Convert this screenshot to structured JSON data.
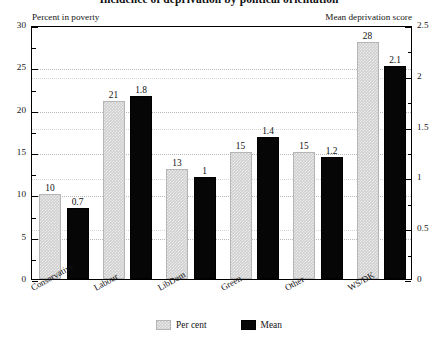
{
  "chart_data": {
    "type": "bar",
    "title": "Incidence of deprivation by political orientation",
    "xlabel": "",
    "ylabel": "Percent in poverty",
    "y2label": "Mean deprivation score",
    "categories": [
      "Conservative",
      "Labour",
      "LibDem",
      "Green",
      "Other",
      "WS/DK"
    ],
    "series": [
      {
        "name": "Per cent",
        "axis": "left",
        "color": "#cfcfcf",
        "values": [
          10,
          21,
          13,
          15,
          15,
          28
        ],
        "labels": [
          "10",
          "21",
          "13",
          "15",
          "15",
          "28"
        ]
      },
      {
        "name": "Mean",
        "axis": "right",
        "color": "#060606",
        "values": [
          0.7,
          1.8,
          1.0,
          1.4,
          1.2,
          2.1
        ],
        "labels": [
          "0.7",
          "1.8",
          "1",
          "1.4",
          "1.2",
          "2.1"
        ]
      }
    ],
    "ylim": [
      0,
      30
    ],
    "y2lim": [
      0,
      2.5
    ],
    "yticks": [
      0,
      5,
      10,
      15,
      20,
      25,
      30
    ],
    "ytick_labels": [
      "0",
      "5",
      "10",
      "15",
      "20",
      "25",
      "30"
    ],
    "y2ticks": [
      0,
      0.5,
      1,
      1.5,
      2,
      2.5
    ],
    "y2tick_labels": [
      "0",
      "0.5",
      "1",
      "1.5",
      "2",
      "2.5"
    ],
    "y_minor_ticks": [
      2.5,
      7.5,
      12.5,
      17.5,
      22.5,
      27.5
    ],
    "y2_minor_ticks": [
      0.25,
      0.75,
      1.25,
      1.75,
      2.25
    ],
    "grid": true,
    "grid_axis": "y",
    "legend": {
      "position": "bottom-center",
      "entries": [
        {
          "label": "Per cent",
          "swatch": "pct"
        },
        {
          "label": "Mean",
          "swatch": "mean"
        }
      ]
    }
  }
}
